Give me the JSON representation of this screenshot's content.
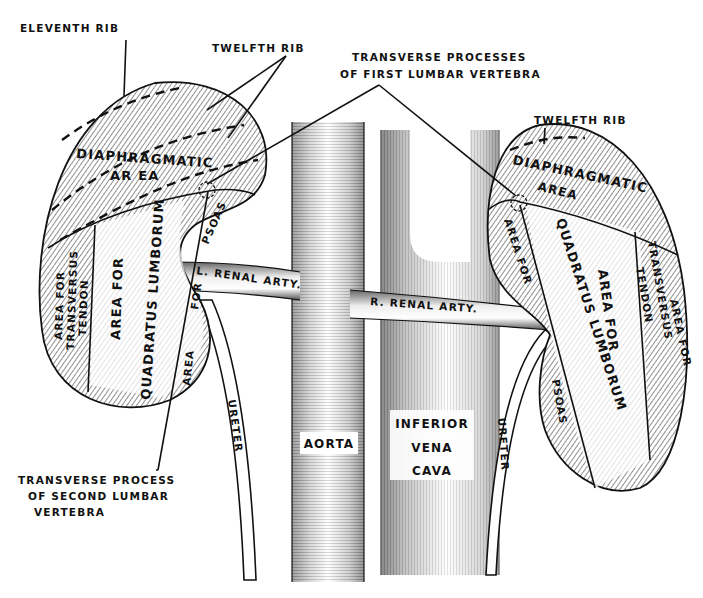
{
  "figure": {
    "labels": {
      "eleventh_rib": "ELEVENTH RIB",
      "twelfth_rib_left": "TWELFTH RIB",
      "twelfth_rib_right": "TWELFTH RIB",
      "transverse_first_line1": "TRANSVERSE PROCESSES",
      "transverse_first_line2": "OF FIRST LUMBAR VERTEBRA",
      "transverse_second_line1": "TRANSVERSE PROCESS",
      "transverse_second_line2": "OF SECOND LUMBAR",
      "transverse_second_line3": "VERTEBRA",
      "left_kidney": {
        "diaphragmatic1": "DIAPHRAGMATIC",
        "diaphragmatic2": "AR EA",
        "transversus1": "AREA FOR",
        "transversus2": "TRANSVERSUS",
        "transversus3": "TENDON",
        "quadratus1": "AREA FOR",
        "quadratus2": "QUADRATUS LUMBORUM",
        "psoas_top": "PSOAS",
        "psoas_for": "FOR",
        "psoas_area": "AREA"
      },
      "right_kidney": {
        "diaphragmatic1": "DIAPHRAGMATIC",
        "diaphragmatic2": "AREA",
        "area_for": "AREA FOR",
        "quadratus1": "QUADRATUS LUMBORUM",
        "quadratus2": "AREA FOR",
        "transversus1": "AREA FOR",
        "transversus2": "TRANSVERSUS",
        "transversus3": "TENDON",
        "psoas": "PSOAS"
      },
      "l_renal_arty": "L. RENAL ARTY.",
      "r_renal_arty": "R. RENAL ARTY.",
      "aorta": "AORTA",
      "ivc1": "INFERIOR",
      "ivc2": "VENA",
      "ivc3": "CAVA",
      "ureter_left": "URETER",
      "ureter_right": "URETER"
    },
    "colors": {
      "ink": "#111111",
      "paper": "#ffffff",
      "shade": "#9a9a9a"
    }
  }
}
